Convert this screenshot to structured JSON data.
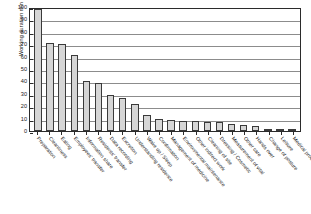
{
  "chart_data": {
    "type": "bar",
    "title": "",
    "xlabel": "",
    "ylabel": "Working duration  min",
    "ylim": [
      0,
      100
    ],
    "ytick_step": 10,
    "yticks": [
      100,
      90,
      80,
      70,
      60,
      50,
      40,
      30,
      20,
      10,
      0
    ],
    "grid": true,
    "legend": "none",
    "orientation": "vertical",
    "bar_fill_color": "#d6d6d6",
    "bar_edge_color": "#3a3a3a",
    "axis_color": "#2b2b2b",
    "gridline_color": "#8c8c8c",
    "background_color": "#ffffff",
    "xtick_label_rotation_deg": 50,
    "categories": [
      "Preparation",
      "Cleanliness",
      "Eating",
      "Employees' transfer",
      "Information share",
      "Residents' transfer",
      "Data recording",
      "Excretion",
      "Understanding residence",
      "Wake up / Sleep",
      "Confirmation",
      "Management of medicine",
      "Environmental maintenance",
      "Other indirect work",
      "Cleaning of site",
      "Dressing / Cosmetic",
      "Measurement of vital",
      "Other care",
      "Hands over",
      "Change of posture",
      "Leisure",
      "Medical procedure"
    ],
    "values": [
      98,
      71,
      70,
      61,
      40,
      39,
      29,
      27,
      22,
      13,
      10,
      9,
      8,
      8,
      7,
      7,
      6,
      5,
      4,
      2,
      1,
      1
    ]
  }
}
